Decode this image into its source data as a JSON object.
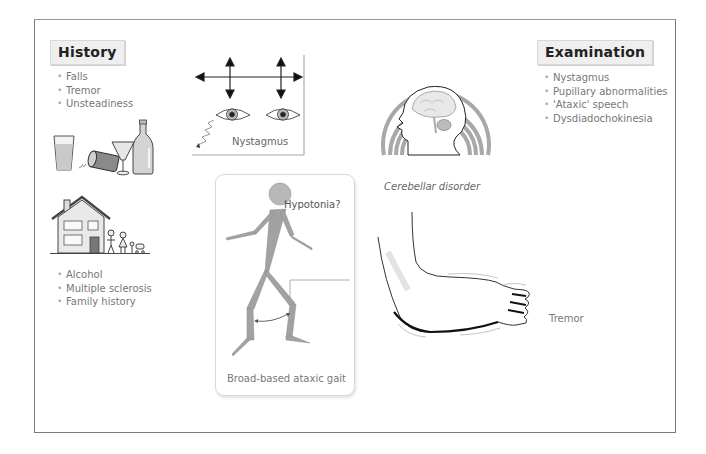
{
  "history": {
    "title": "History",
    "symptoms": [
      "Falls",
      "Tremor",
      "Unsteadiness"
    ],
    "causes": [
      "Alcohol",
      "Multiple sclerosis",
      "Family history"
    ]
  },
  "examination": {
    "title": "Examination",
    "signs": [
      "Nystagmus",
      "Pupillary abnormalities",
      "'Ataxic' speech",
      "Dysdiadochokinesia"
    ]
  },
  "panels": {
    "nystagmus": {
      "caption": "Nystagmus",
      "icon": "eyes-with-arrows-icon"
    },
    "cerebellar": {
      "caption": "Cerebellar disorder",
      "icon": "head-brain-icon"
    },
    "gait": {
      "caption": "Broad-based ataxic gait",
      "annotation": "Hypotonia?",
      "icon": "stick-figure-icon"
    },
    "tremor": {
      "caption": "Tremor",
      "icon": "outstretched-arm-icon"
    }
  },
  "illustrations": {
    "alcohol": "bottles-glasses-icon",
    "family": "house-family-icon"
  },
  "colors": {
    "frame": "#7a7a7a",
    "heading_bg": "#efefef",
    "figure_gray": "#9e9e9e",
    "text_gray": "#777777"
  }
}
